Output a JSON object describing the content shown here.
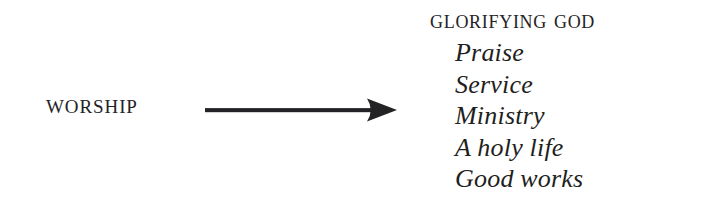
{
  "diagram": {
    "type": "flow-relationship",
    "background_color": "#ffffff",
    "text_color": "#232326",
    "source": {
      "label": "Worship"
    },
    "connector": {
      "icon": "right-arrow-icon",
      "direction": "right",
      "color": "#232326"
    },
    "result": {
      "heading": "Glorifying God",
      "items": [
        "Praise",
        "Service",
        "Ministry",
        "A holy life",
        "Good works"
      ]
    }
  }
}
